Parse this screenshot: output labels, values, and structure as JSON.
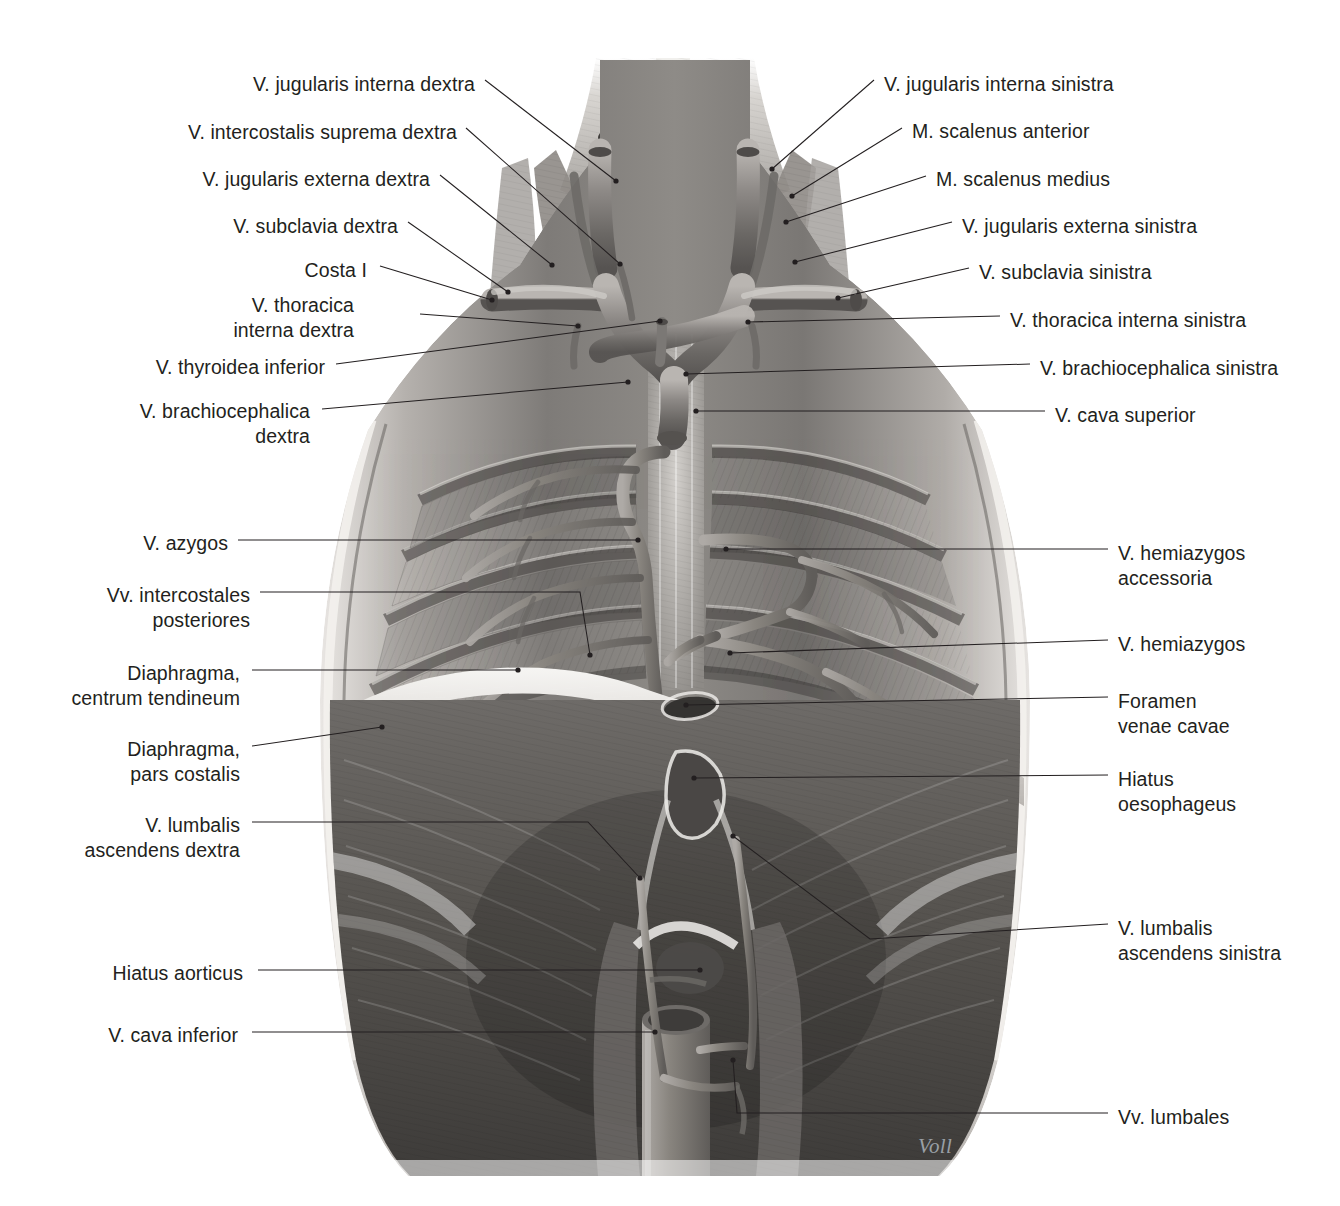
{
  "plate": {
    "title": "Venae of the thorax and posterior abdominal wall",
    "signature": "Voll",
    "palette": {
      "background": "#ffffff",
      "label_text": "#231f20",
      "leader_line": "#231f20",
      "illustration_light": "#f2f0ee",
      "illustration_mid": "#9d9a96",
      "illustration_dark": "#4a4846",
      "illustration_deep": "#2b2a29",
      "signature": "#9aa0a6"
    }
  },
  "labels_left": [
    {
      "id": "v-jugularis-interna-dextra",
      "text": "V. jugularis interna dextra",
      "x": 475,
      "y": 86,
      "align": "right"
    },
    {
      "id": "v-intercostalis-suprema-dextra",
      "text": "V. intercostalis suprema dextra",
      "x": 457,
      "y": 134,
      "align": "right"
    },
    {
      "id": "v-jugularis-externa-dextra",
      "text": "V. jugularis externa dextra",
      "x": 430,
      "y": 181,
      "align": "right"
    },
    {
      "id": "v-subclavia-dextra",
      "text": "V. subclavia dextra",
      "x": 398,
      "y": 228,
      "align": "right"
    },
    {
      "id": "costa-i",
      "text": "Costa I",
      "x": 367,
      "y": 272,
      "align": "right"
    },
    {
      "id": "v-thoracica-interna-dextra",
      "text": "V. thoracica\ninterna dextra",
      "x": 354,
      "y": 307,
      "align": "right"
    },
    {
      "id": "v-thyroidea-inferior",
      "text": "V. thyroidea inferior",
      "x": 325,
      "y": 369,
      "align": "right"
    },
    {
      "id": "v-brachiocephalica-dextra",
      "text": "V. brachiocephalica\ndextra",
      "x": 310,
      "y": 413,
      "align": "right"
    },
    {
      "id": "v-azygos",
      "text": "V. azygos",
      "x": 228,
      "y": 545,
      "align": "right"
    },
    {
      "id": "vv-intercostales-posteriores",
      "text": "Vv. intercostales\nposteriores",
      "x": 250,
      "y": 597,
      "align": "right"
    },
    {
      "id": "diaphragma-centrum-tendineum",
      "text": "Diaphragma,\ncentrum tendineum",
      "x": 240,
      "y": 675,
      "align": "right"
    },
    {
      "id": "diaphragma-pars-costalis",
      "text": "Diaphragma,\npars costalis",
      "x": 240,
      "y": 751,
      "align": "right"
    },
    {
      "id": "v-lumbalis-ascendens-dextra",
      "text": "V. lumbalis\nascendens dextra",
      "x": 240,
      "y": 827,
      "align": "right"
    },
    {
      "id": "hiatus-aorticus",
      "text": "Hiatus aorticus",
      "x": 243,
      "y": 975,
      "align": "right"
    },
    {
      "id": "v-cava-inferior",
      "text": "V. cava inferior",
      "x": 238,
      "y": 1037,
      "align": "right"
    }
  ],
  "labels_right": [
    {
      "id": "v-jugularis-interna-sinistra",
      "text": "V. jugularis interna sinistra",
      "x": 884,
      "y": 86,
      "align": "left"
    },
    {
      "id": "m-scalenus-anterior",
      "text": "M. scalenus anterior",
      "x": 912,
      "y": 133,
      "align": "left"
    },
    {
      "id": "m-scalenus-medius",
      "text": "M. scalenus medius",
      "x": 936,
      "y": 181,
      "align": "left"
    },
    {
      "id": "v-jugularis-externa-sinistra",
      "text": "V. jugularis externa sinistra",
      "x": 962,
      "y": 228,
      "align": "left"
    },
    {
      "id": "v-subclavia-sinistra",
      "text": "V. subclavia sinistra",
      "x": 979,
      "y": 274,
      "align": "left"
    },
    {
      "id": "v-thoracica-interna-sinistra",
      "text": "V. thoracica interna sinistra",
      "x": 1010,
      "y": 322,
      "align": "left"
    },
    {
      "id": "v-brachiocephalica-sinistra",
      "text": "V. brachiocephalica sinistra",
      "x": 1040,
      "y": 370,
      "align": "left"
    },
    {
      "id": "v-cava-superior",
      "text": "V. cava superior",
      "x": 1055,
      "y": 417,
      "align": "left"
    },
    {
      "id": "v-hemiazygos-accessoria",
      "text": "V. hemiazygos\naccessoria",
      "x": 1118,
      "y": 555,
      "align": "left"
    },
    {
      "id": "v-hemiazygos",
      "text": "V. hemiazygos",
      "x": 1118,
      "y": 646,
      "align": "left"
    },
    {
      "id": "foramen-venae-cavae",
      "text": "Foramen\nvenae cavae",
      "x": 1118,
      "y": 703,
      "align": "left"
    },
    {
      "id": "hiatus-oesophageus",
      "text": "Hiatus\noesophageus",
      "x": 1118,
      "y": 781,
      "align": "left"
    },
    {
      "id": "v-lumbalis-ascendens-sinistra",
      "text": "V. lumbalis\nascendens sinistra",
      "x": 1118,
      "y": 930,
      "align": "left"
    },
    {
      "id": "vv-lumbales",
      "text": "Vv. lumbales",
      "x": 1118,
      "y": 1119,
      "align": "left"
    }
  ],
  "leaders_left": [
    {
      "id": "leader-v-jugularis-interna-dextra",
      "points": "485,80 616,181"
    },
    {
      "id": "leader-v-intercostalis-suprema-dextra",
      "points": "466,128 620,264"
    },
    {
      "id": "leader-v-jugularis-externa-dextra",
      "points": "440,175 552,265"
    },
    {
      "id": "leader-v-subclavia-dextra",
      "points": "408,222 508,292"
    },
    {
      "id": "leader-costa-i",
      "points": "380,266 492,300"
    },
    {
      "id": "leader-v-thoracica-interna-dextra",
      "points": "420,314 578,326"
    },
    {
      "id": "leader-v-thyroidea-inferior",
      "points": "336,364 660,321"
    },
    {
      "id": "leader-v-brachiocephalica-dextra",
      "points": "322,409 628,382"
    },
    {
      "id": "leader-v-azygos",
      "points": "238,540 638,540"
    },
    {
      "id": "leader-vv-intercostales-posteriores",
      "points": "260,592 580,592 590,655"
    },
    {
      "id": "leader-diaphragma-centrum-tendineum",
      "points": "252,670 518,670"
    },
    {
      "id": "leader-diaphragma-pars-costalis",
      "points": "252,746 382,727"
    },
    {
      "id": "leader-v-lumbalis-ascendens-dextra",
      "points": "252,822 588,822 640,878"
    },
    {
      "id": "leader-hiatus-aorticus",
      "points": "258,970 700,970"
    },
    {
      "id": "leader-v-cava-inferior",
      "points": "252,1032 655,1032"
    }
  ],
  "leaders_right": [
    {
      "id": "leader-v-jugularis-interna-sinistra",
      "points": "874,80 772,169"
    },
    {
      "id": "leader-m-scalenus-anterior",
      "points": "902,128 792,196"
    },
    {
      "id": "leader-m-scalenus-medius",
      "points": "926,176 786,222"
    },
    {
      "id": "leader-v-jugularis-externa-sinistra",
      "points": "952,222 795,262"
    },
    {
      "id": "leader-v-subclavia-sinistra",
      "points": "969,268 838,298"
    },
    {
      "id": "leader-v-thoracica-interna-sinistra",
      "points": "1000,316 748,322"
    },
    {
      "id": "leader-v-brachiocephalica-sinistra",
      "points": "1030,364 686,374"
    },
    {
      "id": "leader-v-cava-superior",
      "points": "1045,411 696,411"
    },
    {
      "id": "leader-v-hemiazygos-accessoria",
      "points": "1108,549 726,549"
    },
    {
      "id": "leader-v-hemiazygos",
      "points": "1108,640 730,653"
    },
    {
      "id": "leader-foramen-venae-cavae",
      "points": "1108,697 686,705"
    },
    {
      "id": "leader-hiatus-oesophageus",
      "points": "1108,775 694,778"
    },
    {
      "id": "leader-v-lumbalis-ascendens-sinistra",
      "points": "1108,924 870,939 733,836"
    },
    {
      "id": "leader-vv-lumbales",
      "points": "1108,1113 737,1113 733,1060"
    }
  ]
}
